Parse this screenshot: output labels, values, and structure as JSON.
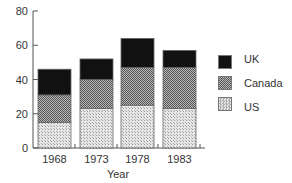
{
  "chart_data": {
    "type": "bar",
    "stacked": true,
    "title": "",
    "xlabel": "Year",
    "ylabel": "",
    "categories": [
      "1968",
      "1973",
      "1978",
      "1983"
    ],
    "series": [
      {
        "name": "US",
        "values": [
          15,
          23,
          25,
          23
        ],
        "pattern": "light-dotted",
        "color": "#d4d4d4"
      },
      {
        "name": "Canada",
        "values": [
          16,
          17,
          22,
          24
        ],
        "pattern": "medium-checker",
        "color": "#8a8a8a"
      },
      {
        "name": "UK",
        "values": [
          15,
          12,
          17,
          10
        ],
        "pattern": "solid-black",
        "color": "#111111"
      }
    ],
    "totals": [
      46,
      52,
      64,
      57
    ],
    "ylim": [
      0,
      80
    ],
    "yticks": [
      0,
      20,
      40,
      60,
      80
    ],
    "grid": false,
    "legend_position": "right",
    "legend_order": [
      "UK",
      "Canada",
      "US"
    ]
  },
  "legend": {
    "items": [
      {
        "label": "UK",
        "color": "#111111"
      },
      {
        "label": "Canada",
        "color": "#8a8a8a"
      },
      {
        "label": "US",
        "color": "#d4d4d4"
      }
    ]
  }
}
